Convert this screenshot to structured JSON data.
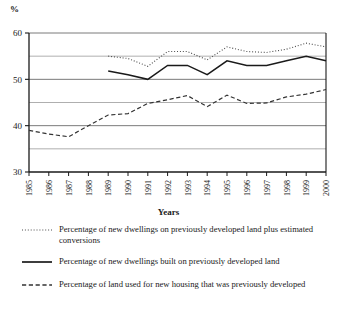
{
  "chart_data": {
    "type": "line",
    "title": "",
    "xlabel": "Years",
    "ylabel": "%",
    "ylim": [
      30,
      60
    ],
    "yticks": [
      30,
      40,
      50,
      60
    ],
    "y_minor_gridlines": [
      35,
      45,
      55
    ],
    "grid": true,
    "legend_position": "below",
    "x": [
      1985,
      1986,
      1987,
      1988,
      1989,
      1990,
      1991,
      1992,
      1993,
      1994,
      1995,
      1996,
      1997,
      1998,
      1999,
      2000
    ],
    "categories": [
      "1985",
      "1986",
      "1987",
      "1988",
      "1989",
      "1990",
      "1991",
      "1992",
      "1993",
      "1994",
      "1995",
      "1996",
      "1997",
      "1998",
      "1999",
      "2000"
    ],
    "series": [
      {
        "name": "Percentage of new dwellings on previously developed land plus estimated conversions",
        "style": "dotted",
        "color": "#4d4d4d",
        "values": [
          null,
          null,
          null,
          null,
          55.0,
          54.5,
          52.8,
          56.0,
          56.0,
          54.2,
          57.0,
          56.0,
          55.8,
          56.5,
          57.8,
          57.0
        ]
      },
      {
        "name": "Percentage of new dwellings built on previously developed land",
        "style": "solid",
        "color": "#1a1a1a",
        "values": [
          null,
          null,
          null,
          null,
          51.8,
          51.0,
          50.0,
          53.0,
          53.0,
          51.0,
          54.0,
          53.0,
          53.0,
          54.0,
          55.0,
          54.0
        ]
      },
      {
        "name": "Percentage of land used for new housing that was previously developed",
        "style": "dashed",
        "color": "#333333",
        "values": [
          39.0,
          38.2,
          37.6,
          40.0,
          42.3,
          42.6,
          44.8,
          45.6,
          46.5,
          44.1,
          46.6,
          44.8,
          44.9,
          46.2,
          46.8,
          47.8
        ]
      }
    ]
  },
  "legend": {
    "entries": [
      {
        "label": "Percentage of new dwellings on previously developed land plus estimated conversions",
        "style": "dotted"
      },
      {
        "label": "Percentage of new dwellings built on previously developed land",
        "style": "solid"
      },
      {
        "label": "Percentage of land used for new housing that was previously developed",
        "style": "dashed"
      }
    ]
  },
  "axis": {
    "y_unit": "%",
    "x_title": "Years"
  }
}
